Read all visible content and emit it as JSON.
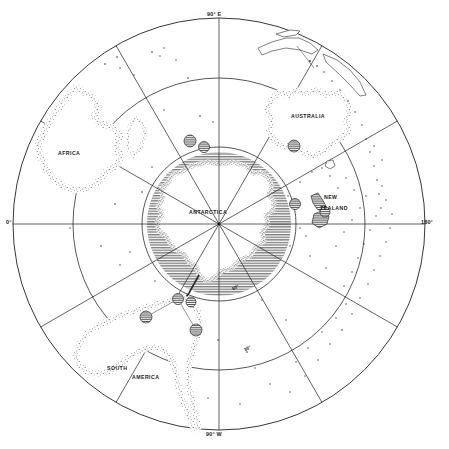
{
  "figure": {
    "kind": "polar-azimuthal-map",
    "center": "South Pole",
    "background_color": "#ffffff",
    "ink_color": "#1a1a1a",
    "ice_shading_color": "#8d8d8d"
  },
  "graticule": {
    "outer_circle_label": "map-boundary",
    "latitude_circles": [
      {
        "id": "lat30",
        "label": "30°",
        "radius_px": 146
      },
      {
        "id": "lat60",
        "label": "60°",
        "radius_px": 77
      }
    ],
    "meridian_labels": {
      "top": "90° E",
      "right": "180°",
      "bottom": "90° W",
      "left": "0°"
    },
    "meridian_spacing_degrees": 30
  },
  "places": [
    {
      "name": "AFRICA",
      "x": 58,
      "y": 152,
      "type": "continent"
    },
    {
      "name": "AUSTRALIA",
      "x": 291,
      "y": 115,
      "type": "continent"
    },
    {
      "name": "NEW",
      "x": 324,
      "y": 197,
      "type": "country-line1"
    },
    {
      "name": "ZEALAND",
      "x": 322,
      "y": 210,
      "type": "country-line2"
    },
    {
      "name": "ANTARCTICA",
      "x": 189,
      "y": 211,
      "type": "continent"
    },
    {
      "name": "SOUTH",
      "x": 107,
      "y": 368,
      "type": "continent-line1"
    },
    {
      "name": "AMERICA",
      "x": 132,
      "y": 377,
      "type": "continent-line2"
    }
  ],
  "markers": {
    "style": "hatched-circle",
    "count": 9,
    "description": "hatched circular site symbols",
    "positions": [
      {
        "x": 190,
        "y": 141
      },
      {
        "x": 203,
        "y": 147
      },
      {
        "x": 294,
        "y": 146
      },
      {
        "x": 295,
        "y": 204
      },
      {
        "x": 322,
        "y": 214
      },
      {
        "x": 318,
        "y": 223
      },
      {
        "x": 178,
        "y": 299
      },
      {
        "x": 191,
        "y": 302
      },
      {
        "x": 146,
        "y": 317
      },
      {
        "x": 196,
        "y": 330
      }
    ]
  },
  "pole_marker": {
    "label": "south-pole-dot",
    "x": 219,
    "y": 224
  }
}
